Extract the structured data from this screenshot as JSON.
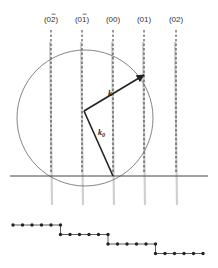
{
  "figure": {
    "type": "Ewald sphere construction for RHEED",
    "rods": [
      {
        "label_main": "0",
        "label_sub": "2",
        "bar": true,
        "x": 51
      },
      {
        "label_main": "0",
        "label_sub": "1",
        "bar": true,
        "x": 82
      },
      {
        "label_main": "0",
        "label_sub": "0",
        "bar": false,
        "x": 113
      },
      {
        "label_main": "0",
        "label_sub": "1",
        "bar": false,
        "x": 144
      },
      {
        "label_main": "0",
        "label_sub": "2",
        "bar": false,
        "x": 176
      }
    ],
    "rod_labels": [
      "(032)",
      "(031)",
      "(00)",
      "(01)",
      "(02)"
    ],
    "vectors": {
      "k": {
        "label": "k",
        "from": [
          84,
          111
        ],
        "to": [
          144,
          75
        ]
      },
      "k0": {
        "label": "k",
        "subscript": "0",
        "from": [
          84,
          111
        ],
        "to": [
          113,
          176
        ]
      }
    },
    "circle": {
      "cx": 85,
      "cy": 118,
      "r": 68
    },
    "surface_line": {
      "y": 176,
      "x1": 10,
      "x2": 208
    },
    "staircase": {
      "steps": 4,
      "dots_per_step": 6,
      "dot_spacing": 9.5,
      "step_height": 9.5,
      "start": [
        13,
        225
      ]
    },
    "colors": {
      "line": "#444444",
      "circle": "#777777",
      "rod_dash": "#333333",
      "rod_glow": "#d0d0d0",
      "vector": "#222222",
      "dot": "#222222"
    }
  }
}
